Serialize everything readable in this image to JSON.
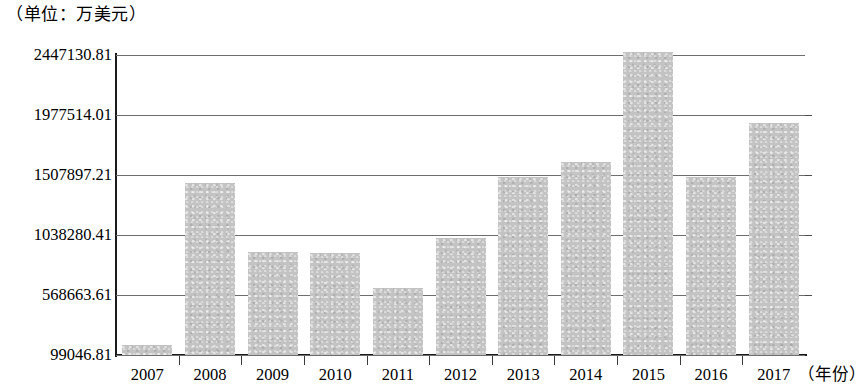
{
  "caption": {
    "unit": "（单位：万美元）"
  },
  "axis": {
    "x_unit_label": "（年份）",
    "y_tick_labels": [
      "2447130.81",
      "1977514.01",
      "1507897.21",
      "1038280.41",
      "568663.61",
      "99046.81"
    ]
  },
  "colors": {
    "bar_fill": "#c3c3c3",
    "gridline": "#6e6e6e",
    "axis": "#1a1a1a",
    "text": "#000000"
  },
  "chart_data": {
    "type": "bar",
    "title": "",
    "subtitle": "",
    "xlabel": "（年份）",
    "ylabel": "（单位：万美元）",
    "categories": [
      "2007",
      "2008",
      "2009",
      "2010",
      "2011",
      "2012",
      "2013",
      "2014",
      "2015",
      "2016",
      "2017"
    ],
    "values": [
      177000,
      1444000,
      905000,
      897000,
      623000,
      1014000,
      1492000,
      1609000,
      2470000,
      1492000,
      1914000
    ],
    "ylim": [
      99046.81,
      2447130.81
    ],
    "ytick_values": [
      99046.81,
      568663.61,
      1038280.41,
      1507897.21,
      1977514.01,
      2447130.81
    ],
    "ytick_labels": [
      "99046.81",
      "568663.61",
      "1038280.41",
      "1507897.21",
      "1977514.01",
      "2447130.81"
    ],
    "grid": true,
    "legend": false,
    "legend_position": "none",
    "series": [
      {
        "name": "",
        "values": [
          177000,
          1444000,
          905000,
          897000,
          623000,
          1014000,
          1492000,
          1609000,
          2470000,
          1492000,
          1914000
        ]
      }
    ]
  }
}
